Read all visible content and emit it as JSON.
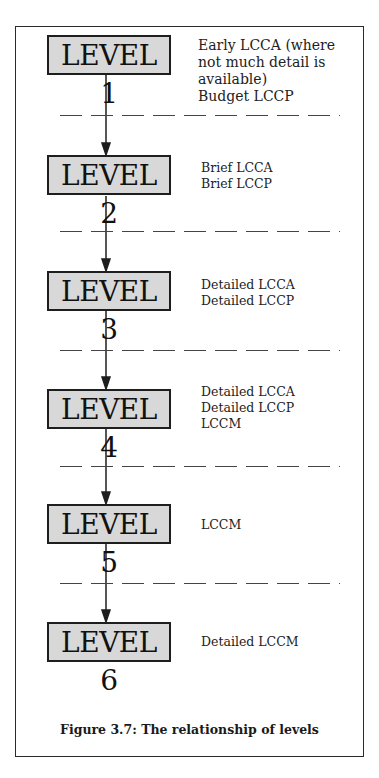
{
  "levels": [
    {
      "label": "LEVEL 1",
      "description": "Early LCCA (where\nnot much detail is\navailable)\nBudget LCCP"
    },
    {
      "label": "LEVEL 2",
      "description": "Brief LCCA\nBrief LCCP"
    },
    {
      "label": "LEVEL 3",
      "description": "Detailed LCCA\nDetailed LCCP"
    },
    {
      "label": "LEVEL 4",
      "description": "Detailed LCCA\nDetailed LCCP\nLCCM"
    },
    {
      "label": "LEVEL 5",
      "description": "LCCM"
    },
    {
      "label": "LEVEL 6",
      "description": "Detailed LCCM"
    }
  ],
  "caption": "Figure 3.7: The relationship of levels",
  "colors": {
    "box_fill": "#d8d8d8",
    "line": "#1e1e1e",
    "background": "#ffffff"
  }
}
